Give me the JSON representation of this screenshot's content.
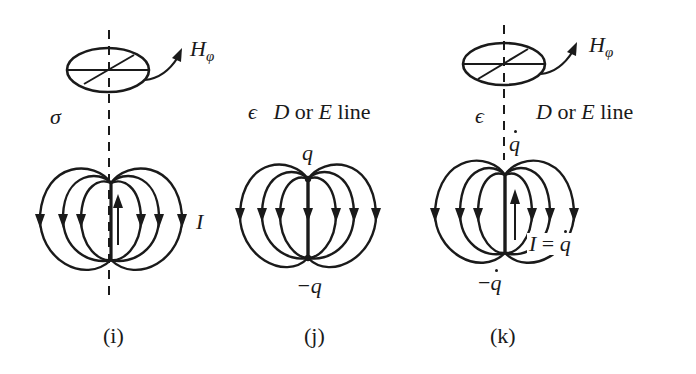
{
  "figure": {
    "panels": [
      {
        "id": "i",
        "caption": "(i)",
        "medium_symbol": "σ",
        "field_label": "H",
        "field_subscript": "φ",
        "source_label": "I",
        "description": "Current element I (upward arrow) with surrounding magnetic field loops, azimuthal H_φ"
      },
      {
        "id": "j",
        "caption": "(j)",
        "medium_symbol": "ϵ",
        "line_label_parts": [
          "D",
          "or",
          "E",
          "line"
        ],
        "top_charge": "q",
        "bottom_charge": "−q",
        "description": "Electric dipole: D or E field lines from +q to −q"
      },
      {
        "id": "k",
        "caption": "(k)",
        "medium_symbol": "ϵ",
        "field_label": "H",
        "field_subscript": "φ",
        "line_label_parts": [
          "D",
          "or",
          "E",
          "line"
        ],
        "top_charge": "q",
        "bottom_charge": "−q",
        "current_label_lhs": "I",
        "current_label_eq": "=",
        "current_label_rhs": "q",
        "description": "Time-varying dipole: displacement current I = q̇ with D/E lines and H_φ"
      }
    ],
    "colors": {
      "ink": "#1a1a1a",
      "background": "#ffffff"
    }
  }
}
